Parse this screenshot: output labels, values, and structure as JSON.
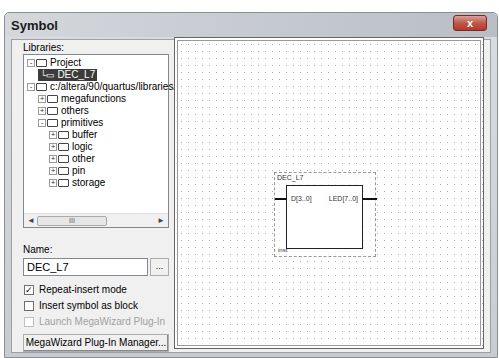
{
  "window": {
    "title": "Symbol",
    "close_glyph": "x"
  },
  "libraries": {
    "label": "Libraries:",
    "tree": [
      {
        "label": "Project",
        "expander": "-",
        "icon": "folder-open",
        "indent": 0,
        "selected": false
      },
      {
        "label": "DEC_L7",
        "expander": "",
        "icon": "symbol",
        "indent": 1,
        "selected": true
      },
      {
        "label": "c:/altera/90/quartus/libraries/",
        "expander": "-",
        "icon": "folder-open",
        "indent": 0,
        "selected": false
      },
      {
        "label": "megafunctions",
        "expander": "+",
        "icon": "folder",
        "indent": 1,
        "selected": false
      },
      {
        "label": "others",
        "expander": "+",
        "icon": "folder",
        "indent": 1,
        "selected": false
      },
      {
        "label": "primitives",
        "expander": "-",
        "icon": "folder-open",
        "indent": 1,
        "selected": false
      },
      {
        "label": "buffer",
        "expander": "+",
        "icon": "folder",
        "indent": 2,
        "selected": false
      },
      {
        "label": "logic",
        "expander": "+",
        "icon": "folder",
        "indent": 2,
        "selected": false
      },
      {
        "label": "other",
        "expander": "+",
        "icon": "folder",
        "indent": 2,
        "selected": false
      },
      {
        "label": "pin",
        "expander": "+",
        "icon": "folder",
        "indent": 2,
        "selected": false
      },
      {
        "label": "storage",
        "expander": "+",
        "icon": "folder",
        "indent": 2,
        "selected": false
      }
    ],
    "scroll_thumb_glyph": "III",
    "scroll_left": "◄",
    "scroll_right": "►"
  },
  "name": {
    "label": "Name:",
    "value": "DEC_L7",
    "browse_label": "..."
  },
  "options": {
    "repeat_insert": {
      "label": "Repeat-insert mode",
      "checked": true,
      "check_glyph": "✓"
    },
    "insert_as_block": {
      "label": "Insert symbol as block",
      "checked": false
    },
    "launch_megawizard": {
      "label": "Launch MegaWizard Plug-In",
      "checked": false,
      "disabled": true
    }
  },
  "buttons": {
    "megawizard": "MegaWizard Plug-In Manager...",
    "ok": "OK",
    "cancel": "Cancel"
  },
  "preview": {
    "symbol_name": "DEC_L7",
    "input_port": "D[3..0]",
    "output_port": "LED[7..0]",
    "instance": "inst"
  }
}
